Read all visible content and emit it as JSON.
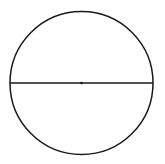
{
  "diagram": {
    "type": "circle-with-diameter",
    "stroke_color": "#1a1a1a",
    "background_color": "#ffffff"
  }
}
